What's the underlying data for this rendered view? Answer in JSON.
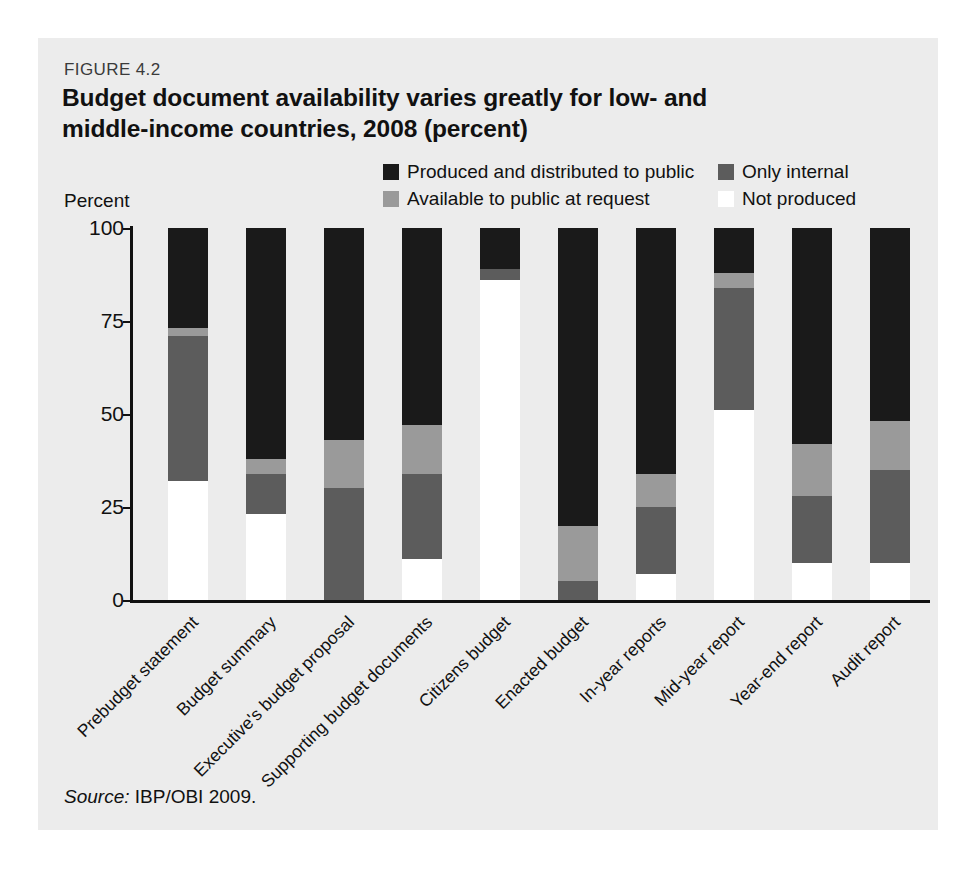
{
  "figure": {
    "number": "FIGURE 4.2",
    "title": "Budget document availability varies greatly for low- and middle-income countries, 2008 (percent)",
    "source": "Source:",
    "source_text": "IBP/OBI 2009."
  },
  "axis": {
    "y_axis_title": "Percent",
    "y_ticks": [
      "100",
      "75",
      "50",
      "25",
      "0"
    ],
    "y_tick_values": [
      100,
      75,
      50,
      25,
      0
    ]
  },
  "colors": {
    "produced_and_distributed": "#1a1a1a",
    "only_internal": "#5c5c5c",
    "available_at_request": "#9a9a9a",
    "not_produced": "#ffffff",
    "panel_background": "#ececec",
    "page_background": "#ffffff",
    "axis": "#111111",
    "text": "#111111"
  },
  "legend": [
    {
      "label": "Produced and distributed to public",
      "color": "#1a1a1a",
      "column": "a"
    },
    {
      "label": "Only internal",
      "color": "#5c5c5c",
      "column": "b"
    },
    {
      "label": "Available to public at request",
      "color": "#9a9a9a",
      "column": "a"
    },
    {
      "label": "Not produced",
      "color": "#ffffff",
      "column": "b"
    }
  ],
  "chart_data": {
    "type": "bar",
    "subtype": "stacked-vertical-100percent",
    "title": "Budget document availability varies greatly for low- and middle-income countries, 2008 (percent)",
    "xlabel": "",
    "ylabel": "Percent",
    "ylim": [
      0,
      100
    ],
    "yticks": [
      0,
      25,
      50,
      75,
      100
    ],
    "grid": false,
    "legend_position": "top-right",
    "categories": [
      "Prebudget statement",
      "Budget summary",
      "Executive's budget proposal",
      "Supporting budget documents",
      "Citizens budget",
      "Enacted budget",
      "In-year reports",
      "Mid-year report",
      "Year-end report",
      "Audit report"
    ],
    "series": [
      {
        "name": "Produced and distributed to public",
        "color": "#1a1a1a",
        "values": [
          27,
          62,
          57,
          53,
          11,
          80,
          66,
          12,
          58,
          52
        ]
      },
      {
        "name": "Available to public at request",
        "color": "#9a9a9a",
        "values": [
          2,
          4,
          13,
          13,
          0,
          15,
          9,
          4,
          14,
          13
        ]
      },
      {
        "name": "Only internal",
        "color": "#5c5c5c",
        "values": [
          39,
          11,
          30,
          23,
          3,
          5,
          18,
          33,
          18,
          25
        ]
      },
      {
        "name": "Not produced",
        "color": "#ffffff",
        "values": [
          32,
          23,
          0,
          11,
          86,
          0,
          7,
          51,
          10,
          10
        ]
      }
    ]
  }
}
